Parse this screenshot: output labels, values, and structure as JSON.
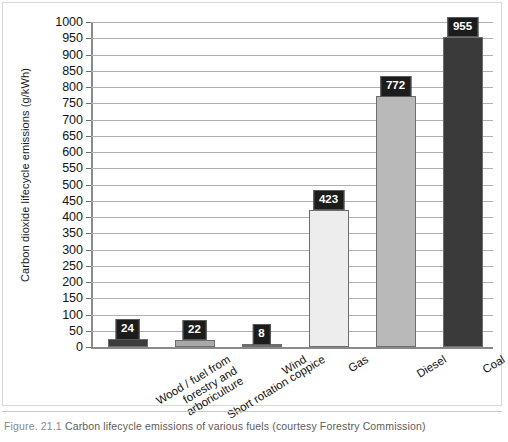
{
  "caption": {
    "figure_number": "Figure. 21.1",
    "text": "Carbon lifecycle emissions of various fuels (courtesy Forestry Commission)"
  },
  "chart_data": {
    "type": "bar",
    "title": "",
    "xlabel": "",
    "ylabel": "Carbon dioxide lifecycle emissions (g/kWh)",
    "ylim": [
      0,
      1000
    ],
    "ytick_step": 50,
    "yticks": [
      0,
      50,
      100,
      150,
      200,
      250,
      300,
      350,
      400,
      450,
      500,
      550,
      600,
      650,
      700,
      750,
      800,
      850,
      900,
      950,
      1000
    ],
    "ytick_labels": [
      "0",
      "50",
      "100",
      "150",
      "200",
      "250",
      "300",
      "350",
      "400",
      "450",
      "500",
      "550",
      "600",
      "650",
      "700",
      "750",
      "800",
      "850",
      "900",
      "950",
      "1000"
    ],
    "grid": true,
    "legend": "none",
    "categories": [
      "Wood / fuel from\nforestry and\narboriculture",
      "Short rotation coppice",
      "Wind",
      "Gas",
      "Diesel",
      "Coal"
    ],
    "values": [
      24,
      22,
      8,
      423,
      772,
      955
    ],
    "data_labels": [
      "24",
      "22",
      "8",
      "423",
      "772",
      "955"
    ],
    "bar_colors": [
      "#3c3c3c",
      "#a9a9a9",
      "#6e6e6e",
      "#ededed",
      "#b9b9b9",
      "#3a3a3a"
    ],
    "bar_border_color": "#6d6d6d"
  },
  "colors": {
    "gridline": "#b0b0b0",
    "axis": "#8a8a8a",
    "label_box_bg": "#1c1c1c",
    "label_box_text": "#ffffff",
    "caption_text": "#5c5c5c",
    "frame": "#d8d8d8"
  }
}
